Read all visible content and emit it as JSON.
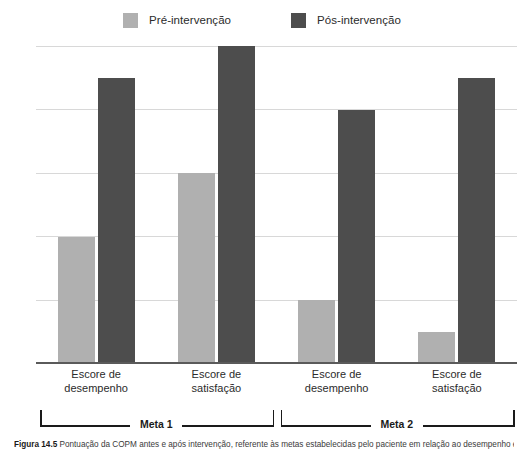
{
  "legend": {
    "items": [
      {
        "label": "Pré-intervenção",
        "color": "#b0b0b0",
        "icon": "legend-swatch-icon"
      },
      {
        "label": "Pós-intervenção",
        "color": "#4d4d4d",
        "icon": "legend-swatch-icon"
      }
    ]
  },
  "caption": {
    "figure_number": "Figura 14.5",
    "text": "Pontuação da COPM antes e após intervenção, referente às metas estabelecidas pelo paciente em relação ao desempenho e satisfação."
  },
  "groups": [
    {
      "label": "Meta 1"
    },
    {
      "label": "Meta 2"
    }
  ],
  "chart_data": {
    "type": "bar",
    "title": "",
    "xlabel": "",
    "ylabel": "",
    "ylim": [
      0,
      10
    ],
    "yticks": [
      "0",
      "2",
      "4",
      "6",
      "8",
      "10"
    ],
    "grid": true,
    "legend_position": "top-center",
    "categories": [
      "Escore de desempenho",
      "Escore de satisfação",
      "Escore de desempenho",
      "Escore de satisfação"
    ],
    "category_lines": [
      [
        "Escore de",
        "desempenho"
      ],
      [
        "Escore de",
        "satisfação"
      ],
      [
        "Escore de",
        "desempenho"
      ],
      [
        "Escore de",
        "satisfação"
      ]
    ],
    "groups": [
      "Meta 1",
      "Meta 1",
      "Meta 2",
      "Meta 2"
    ],
    "series": [
      {
        "name": "Pré-intervenção",
        "color": "#b0b0b0",
        "values": [
          4,
          6,
          2,
          1
        ]
      },
      {
        "name": "Pós-intervenção",
        "color": "#4d4d4d",
        "values": [
          9,
          10,
          8,
          9
        ]
      }
    ]
  }
}
